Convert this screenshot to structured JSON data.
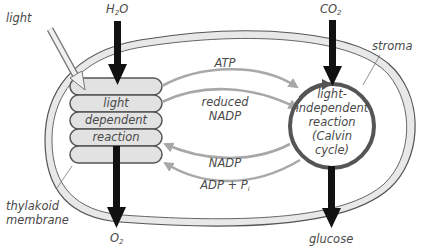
{
  "diagram": {
    "inputs": {
      "water": "H",
      "water_sub": "2",
      "water_tail": "O",
      "co2": "CO",
      "co2_sub": "2"
    },
    "outputs": {
      "oxygen": "O",
      "oxygen_sub": "2",
      "glucose": "glucose"
    },
    "labels": {
      "light": "light",
      "stroma": "stroma",
      "thylakoid_1": "thylakoid",
      "thylakoid_2": "membrane"
    },
    "light_dependent": {
      "line1": "light",
      "line2": "dependent",
      "line3": "reaction"
    },
    "light_independent": {
      "line1": "light-",
      "line2": "independent",
      "line3": "reaction",
      "line4": "(Calvin",
      "line5": "cycle)"
    },
    "flows": {
      "atp": "ATP",
      "reduced_nadp_1": "reduced",
      "reduced_nadp_2": "NADP",
      "nadp": "NADP",
      "adp": "ADP + P",
      "adp_sub": "i"
    },
    "colors": {
      "membrane_fill": "#e6e6e6",
      "outline": "#555555",
      "arrow_gray": "#a8a8a8",
      "arrow_black": "#111111",
      "cycle": "#555555"
    }
  }
}
